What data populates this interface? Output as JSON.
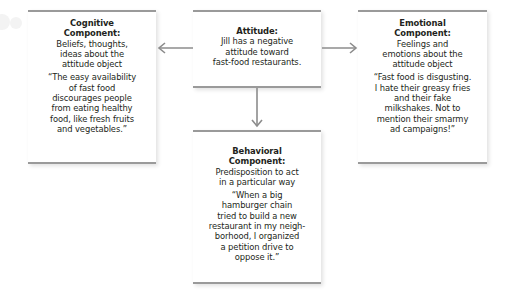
{
  "diagram": {
    "attitude": {
      "title": "Attitude:",
      "lines": [
        "Jill has a negative",
        "attitude toward",
        "fast-food restaurants."
      ]
    },
    "cognitive": {
      "title_lines": [
        "Cognitive",
        "Component:"
      ],
      "description_lines": [
        "Beliefs, thoughts,",
        "ideas about the",
        "attitude object"
      ],
      "quote_lines": [
        "“The easy availability",
        "of fast food",
        "discourages people",
        "from eating healthy",
        "food, like fresh fruits",
        "and vegetables.”"
      ]
    },
    "emotional": {
      "title_lines": [
        "Emotional",
        "Component:"
      ],
      "description_lines": [
        "Feelings and",
        "emotions about the",
        "attitude object"
      ],
      "quote_lines": [
        "“Fast food is disgusting.",
        "I hate their greasy fries",
        "and their fake",
        "milkshakes. Not to",
        "mention their smarmy",
        "ad campaigns!”"
      ]
    },
    "behavioral": {
      "title_lines": [
        "Behavioral",
        "Component:"
      ],
      "description_lines": [
        "Predisposition to act",
        "in a particular way"
      ],
      "quote_lines": [
        "“When a big",
        "hamburger chain",
        "tried to build a new",
        "restaurant in my neigh-",
        "borhood, I organized",
        "a petition drive to",
        "oppose it.”"
      ]
    },
    "colors": {
      "border": "#9a9a9a",
      "arrow": "#8c8c8c",
      "text": "#231f20"
    }
  }
}
